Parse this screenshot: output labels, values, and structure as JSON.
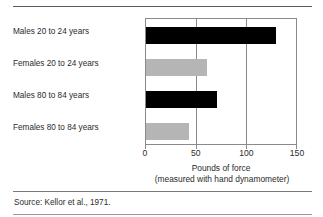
{
  "figure": {
    "source_note": "Source: Kellor et al., 1971."
  },
  "chart_data": {
    "type": "bar",
    "orientation": "horizontal",
    "title": "",
    "subtitle": "",
    "categories": [
      "Males 20 to 24 years",
      "Females 20 to 24 years",
      "Males 80 to 84 years",
      "Females 80 to 84 years"
    ],
    "values": [
      128,
      60,
      70,
      42
    ],
    "bar_colors": [
      "#000000",
      "#b5b5b5",
      "#000000",
      "#b5b5b5"
    ],
    "xlabel": "Pounds of force",
    "xlabel_sub": "(measured with hand dynamometer)",
    "ylabel": "",
    "xlim": [
      0,
      150
    ],
    "xticks": [
      0,
      50,
      100,
      150
    ],
    "xtick_labels": [
      "0",
      "50",
      "100",
      "150"
    ],
    "grid": true,
    "gridlines_at": [
      50,
      100
    ],
    "legend": false
  },
  "colors": {
    "male_bar": "#000000",
    "female_bar": "#b5b5b5",
    "axis": "#8a8a8a",
    "rule": "#6d6d6d",
    "text": "#2b2b2b"
  }
}
